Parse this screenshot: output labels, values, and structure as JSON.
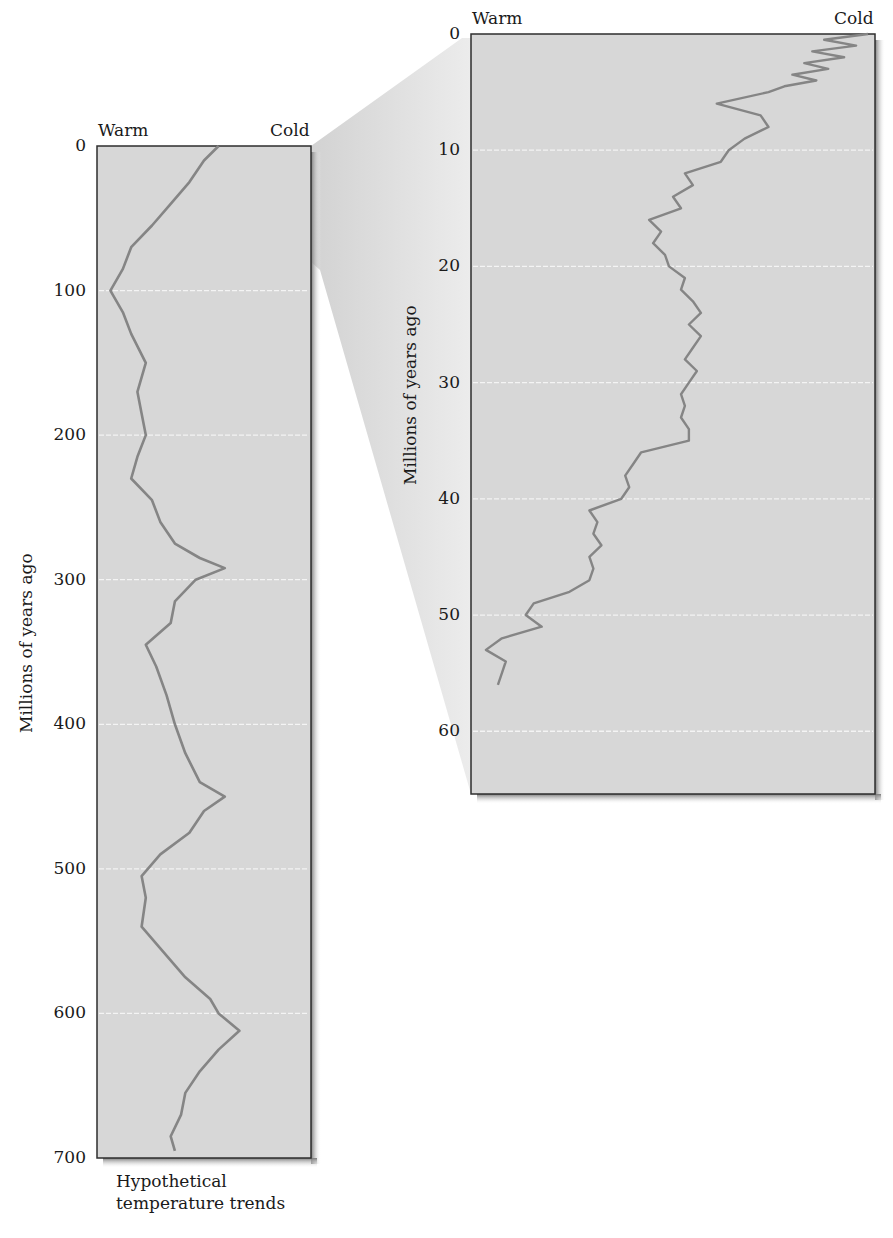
{
  "colors": {
    "panel_fill": "#d7d7d7",
    "curve": "#858585",
    "frame": "#2e2e2e",
    "gridline": "#f4f4f4",
    "wedge": "#e2e2e2"
  },
  "left_panel": {
    "header_left": "Warm",
    "header_right": "Cold",
    "ylabel": "Millions of years ago",
    "ticks": [
      "0",
      "100",
      "200",
      "300",
      "400",
      "500",
      "600",
      "700"
    ],
    "caption_line1": "Hypothetical",
    "caption_line2": "temperature trends"
  },
  "right_panel": {
    "header_left": "Warm",
    "header_right": "Cold",
    "ylabel": "Millions of years ago",
    "ticks": [
      "0",
      "10",
      "20",
      "30",
      "40",
      "50",
      "60"
    ]
  },
  "chart_data": [
    {
      "type": "line",
      "title": "Hypothetical temperature trends",
      "orientation": "vertical (time on y-axis, temperature on x-axis)",
      "xlabel": "Warm ← → Cold",
      "ylabel": "Millions of years ago",
      "ylim": [
        0,
        700
      ],
      "xlim": [
        0,
        100
      ],
      "x_note": "relative temperature index, 0 = warm (left), 100 = cold (right); no numeric x ticks shown",
      "yticks": [
        0,
        100,
        200,
        300,
        400,
        500,
        600,
        700
      ],
      "grid": "horizontal dashed white lines at 100-Myr intervals",
      "series": [
        {
          "name": "temperature",
          "y": [
            0,
            10,
            25,
            40,
            55,
            70,
            85,
            100,
            115,
            130,
            150,
            170,
            185,
            200,
            215,
            230,
            245,
            260,
            275,
            285,
            292,
            300,
            315,
            330,
            345,
            360,
            380,
            400,
            420,
            440,
            450,
            460,
            475,
            490,
            505,
            520,
            540,
            555,
            575,
            590,
            600,
            612,
            625,
            640,
            655,
            670,
            685,
            695
          ],
          "x": [
            57,
            50,
            43,
            34,
            25,
            15,
            11,
            5,
            11,
            15,
            22,
            18,
            20,
            22,
            18,
            15,
            25,
            29,
            36,
            48,
            60,
            46,
            36,
            34,
            22,
            27,
            32,
            36,
            41,
            48,
            60,
            50,
            43,
            29,
            20,
            22,
            20,
            29,
            41,
            53,
            57,
            67,
            57,
            48,
            41,
            39,
            34,
            36
          ]
        }
      ]
    },
    {
      "type": "line",
      "title": "Zoomed view: last ~60 million years",
      "orientation": "vertical (time on y-axis, temperature on x-axis)",
      "xlabel": "Warm ← → Cold",
      "ylabel": "Millions of years ago",
      "ylim": [
        0,
        65
      ],
      "xlim": [
        0,
        100
      ],
      "x_note": "relative temperature index, 0 = warm (left), 100 = cold (right)",
      "yticks": [
        0,
        10,
        20,
        30,
        40,
        50,
        60
      ],
      "grid": "horizontal dashed white lines at 10-Myr intervals",
      "series": [
        {
          "name": "temperature",
          "y": [
            0,
            0.5,
            1,
            1.5,
            2,
            2.5,
            3,
            3.5,
            4,
            4.5,
            5,
            6,
            7,
            8,
            9,
            10,
            11,
            12,
            13,
            14,
            15,
            16,
            17,
            18,
            19,
            20,
            21,
            22,
            23,
            24,
            25,
            26,
            27,
            28,
            29,
            30,
            31,
            32,
            33,
            34,
            35,
            36,
            37,
            38,
            39,
            40,
            41,
            42,
            43,
            44,
            45,
            46,
            47,
            48,
            49,
            50,
            51,
            52,
            53,
            54,
            55,
            56
          ],
          "x": [
            99,
            88,
            96,
            85,
            93,
            83,
            89,
            80,
            86,
            78,
            74,
            61,
            72,
            74,
            68,
            64,
            62,
            53,
            55,
            50,
            52,
            44,
            47,
            45,
            48,
            49,
            53,
            52,
            55,
            57,
            54,
            57,
            55,
            53,
            56,
            54,
            52,
            53,
            52,
            54,
            54,
            42,
            40,
            38,
            39,
            37,
            29,
            31,
            30,
            32,
            29,
            30,
            29,
            24,
            15,
            13,
            17,
            7,
            3,
            8,
            7,
            6
          ]
        }
      ]
    }
  ]
}
